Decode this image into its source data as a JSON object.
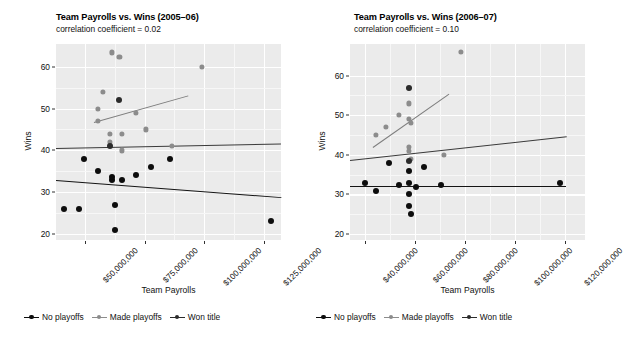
{
  "figure": {
    "width": 595,
    "height": 345,
    "panel_bg": "#ebebeb",
    "grid_color": "#ffffff"
  },
  "colors": {
    "no_playoffs": "#0d0d0d",
    "made_playoffs": "#8c8c8c",
    "won_title": "#2b2b2b"
  },
  "legend": {
    "items": [
      {
        "label": "No playoffs",
        "key": "no_playoffs",
        "color": "#0d0d0d"
      },
      {
        "label": "Made playoffs",
        "key": "made_playoffs",
        "color": "#8c8c8c"
      },
      {
        "label": "Won title",
        "key": "won_title",
        "color": "#2b2b2b"
      }
    ]
  },
  "chart_data": [
    {
      "type": "scatter",
      "panel": "left",
      "title": "Team Payrolls vs. Wins (2005–06)",
      "subtitle": "correlation coefficient = 0.02",
      "xlabel": "Team Payrolls",
      "ylabel": "Wins",
      "grid": true,
      "legend_position": "bottom",
      "xlim": [
        38000000,
        132000000
      ],
      "ylim": [
        18.5,
        65.5
      ],
      "xticks": [
        50000000,
        75000000,
        100000000,
        125000000
      ],
      "xticklabels": [
        "$50,000,000",
        "$75,000,000",
        "$100,000,000",
        "$125,000,000"
      ],
      "yticks": [
        20,
        30,
        40,
        50,
        60
      ],
      "yticklabels": [
        "20",
        "30",
        "40",
        "50",
        "60"
      ],
      "series": [
        {
          "name": "No playoffs",
          "color": "#0d0d0d",
          "points": [
            [
              41500000,
              26
            ],
            [
              47500000,
              26
            ],
            [
              49500000,
              38
            ],
            [
              55500000,
              35
            ],
            [
              61500000,
              33
            ],
            [
              61500000,
              33.5
            ],
            [
              62500000,
              21
            ],
            [
              62500000,
              27
            ],
            [
              65500000,
              33
            ],
            [
              71500000,
              34
            ],
            [
              77500000,
              36
            ],
            [
              85500000,
              38
            ],
            [
              128000000,
              23
            ]
          ]
        },
        {
          "name": "Made playoffs",
          "color": "#8c8c8c",
          "points": [
            [
              55500000,
              47
            ],
            [
              55500000,
              50
            ],
            [
              57500000,
              54
            ],
            [
              60500000,
              42
            ],
            [
              60500000,
              44
            ],
            [
              65500000,
              40
            ],
            [
              65500000,
              44
            ],
            [
              71500000,
              49
            ],
            [
              61500000,
              63.5
            ],
            [
              64500000,
              62.5
            ],
            [
              75500000,
              45
            ],
            [
              86500000,
              41
            ],
            [
              99000000,
              60
            ]
          ]
        },
        {
          "name": "Won title",
          "color": "#2b2b2b",
          "points": [
            [
              64500000,
              52
            ],
            [
              60500000,
              41
            ]
          ]
        }
      ],
      "trendlines": [
        {
          "name": "No playoffs",
          "color": "#141414",
          "x1": 38000000,
          "y1": 33.0,
          "x2": 132000000,
          "y2": 28.9
        },
        {
          "name": "Made playoffs",
          "color": "#7d7d7d",
          "x1": 54000000,
          "y1": 46.8,
          "x2": 93500000,
          "y2": 53.2
        },
        {
          "name": "Won title",
          "color": "#3a3a3a",
          "x1": 38000000,
          "y1": 40.5,
          "x2": 132000000,
          "y2": 41.6
        }
      ]
    },
    {
      "type": "scatter",
      "panel": "right",
      "title": "Team Payrolls vs. Wins (2006–07)",
      "subtitle": "correlation coefficient = 0.10",
      "xlabel": "Team Payrolls",
      "ylabel": "Wins",
      "grid": true,
      "legend_position": "bottom",
      "xlim": [
        34000000,
        128000000
      ],
      "ylim": [
        18.5,
        68.0
      ],
      "xticks": [
        40000000,
        60000000,
        80000000,
        100000000,
        120000000
      ],
      "xticklabels": [
        "$40,000,000",
        "$60,000,000",
        "$80,000,000",
        "$100,000,000",
        "$120,000,000"
      ],
      "yticks": [
        20,
        30,
        40,
        50,
        60
      ],
      "yticklabels": [
        "20",
        "30",
        "40",
        "50",
        "60"
      ],
      "series": [
        {
          "name": "No playoffs",
          "color": "#0d0d0d",
          "points": [
            [
              40000000,
              33
            ],
            [
              44500000,
              31
            ],
            [
              49500000,
              38
            ],
            [
              53500000,
              32.5
            ],
            [
              57500000,
              36
            ],
            [
              57500000,
              33
            ],
            [
              57500000,
              30
            ],
            [
              57500000,
              27
            ],
            [
              58500000,
              25
            ],
            [
              60500000,
              32
            ],
            [
              63500000,
              37
            ],
            [
              70500000,
              32.5
            ],
            [
              118000000,
              33
            ]
          ]
        },
        {
          "name": "Made playoffs",
          "color": "#8c8c8c",
          "points": [
            [
              44500000,
              45
            ],
            [
              48500000,
              47
            ],
            [
              53500000,
              50
            ],
            [
              57500000,
              49
            ],
            [
              58500000,
              48
            ],
            [
              57500000,
              53
            ],
            [
              57500000,
              57
            ],
            [
              57500000,
              41
            ],
            [
              57500000,
              42
            ],
            [
              58500000,
              39
            ],
            [
              71500000,
              40
            ],
            [
              78500000,
              66
            ]
          ]
        },
        {
          "name": "Won title",
          "color": "#2b2b2b",
          "points": [
            [
              57500000,
              57
            ],
            [
              57500000,
              38.5
            ]
          ]
        }
      ],
      "trendlines": [
        {
          "name": "No playoffs",
          "color": "#141414",
          "x1": 34000000,
          "y1": 32.2,
          "x2": 120500000,
          "y2": 32.2
        },
        {
          "name": "Made playoffs",
          "color": "#7d7d7d",
          "x1": 43000000,
          "y1": 42.0,
          "x2": 73500000,
          "y2": 55.5
        },
        {
          "name": "Won title",
          "color": "#3a3a3a",
          "x1": 34000000,
          "y1": 38.8,
          "x2": 120500000,
          "y2": 44.8
        }
      ]
    }
  ]
}
